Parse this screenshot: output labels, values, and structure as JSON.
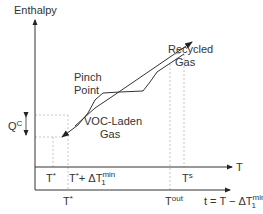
{
  "diagram": {
    "y_axis_label": "Enthalpy",
    "x_axis_label": "T",
    "shifted_axis_label_main": "t = T − ΔT",
    "shifted_axis_label_sup": "min",
    "shifted_axis_label_sub": "1",
    "curves": [
      {
        "name": "Recycled Gas",
        "label_line1": "Recycled",
        "label_line2": "Gas"
      },
      {
        "name": "VOC-Laden Gas",
        "label_line1": "VOC-Laden",
        "label_line2": "Gas"
      }
    ],
    "pinch_label_line1": "Pinch",
    "pinch_label_line2": "Point",
    "heat_label": "Q",
    "heat_label_sup": "C",
    "ticks_upper": {
      "t_star": "T",
      "t_star_sup": "*",
      "t_star_plus": "T",
      "t_star_plus_sup": "*",
      "t_star_plus_rest": "+ ΔT",
      "t_star_plus_min": "min",
      "t_star_plus_sub": "1",
      "t_s": "T",
      "t_s_sup": "s"
    },
    "ticks_lower": {
      "t_star": "T",
      "t_star_sup": "*",
      "t_out": "T",
      "t_out_sup": "out"
    },
    "colors": {
      "line": "#333333",
      "dashed": "#b0b0b0"
    }
  }
}
